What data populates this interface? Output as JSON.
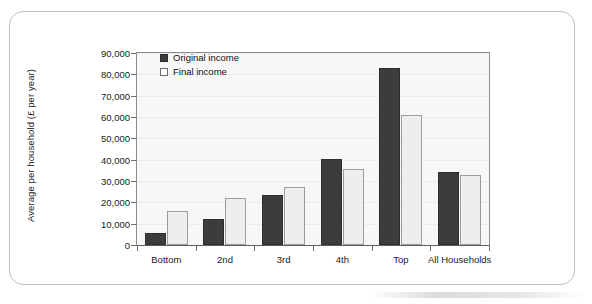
{
  "chart_data": {
    "type": "bar",
    "title": "",
    "xlabel": "",
    "ylabel": "Average per household (£ per year)",
    "ylim": [
      0,
      90000
    ],
    "yticks": [
      0,
      10000,
      20000,
      30000,
      40000,
      50000,
      60000,
      70000,
      80000,
      90000
    ],
    "ytick_labels": [
      "0",
      "10,000",
      "20,000",
      "30,000",
      "40,000",
      "50,000",
      "60,000",
      "70,000",
      "80,000",
      "90,000"
    ],
    "grid": true,
    "legend_position": "top-left",
    "categories": [
      "Bottom",
      "2nd",
      "3rd",
      "4th",
      "Top",
      "All Households"
    ],
    "series": [
      {
        "name": "Original income",
        "color": "#3c3c3c",
        "values": [
          5500,
          12400,
          23500,
          40200,
          83000,
          34000
        ]
      },
      {
        "name": "Final income",
        "color": "#eeeeee",
        "values": [
          15800,
          22200,
          27400,
          35800,
          61000,
          33000
        ]
      }
    ]
  },
  "legend": {
    "entries": [
      {
        "label": "Original income",
        "swatch": "original"
      },
      {
        "label": "Final income",
        "swatch": "final"
      }
    ]
  },
  "colors": {
    "original_bar": "#3c3c3c",
    "final_bar": "#eeeeee",
    "plot_background": "#f7f7f7",
    "axis": "#6a6d70",
    "frame_border": "#b9bcc0"
  }
}
